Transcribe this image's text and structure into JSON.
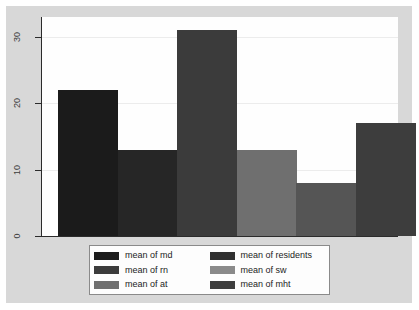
{
  "chart_data": {
    "type": "bar",
    "title": "",
    "subtitle": "",
    "xlabel": "",
    "ylabel": "",
    "categories": [
      "md",
      "rn",
      "at",
      "residents",
      "sw",
      "mht"
    ],
    "values": [
      22,
      13,
      31,
      13,
      8,
      17
    ],
    "series": [
      {
        "name": "means",
        "values": [
          22,
          13,
          31,
          13,
          8,
          17
        ]
      }
    ],
    "bars": [
      {
        "category": "md",
        "label": "mean of md",
        "value": 22,
        "color": "#1b1b1b"
      },
      {
        "category": "rn",
        "label": "mean of rn",
        "value": 13,
        "color": "#262626"
      },
      {
        "category": "at",
        "label": "mean of at",
        "value": 31,
        "color": "#3b3b3b"
      },
      {
        "category": "residents",
        "label": "mean of residents",
        "value": 13,
        "color": "#6f6f6f"
      },
      {
        "category": "sw",
        "label": "mean of sw",
        "value": 8,
        "color": "#555555"
      },
      {
        "category": "mht",
        "label": "mean of mht",
        "value": 17,
        "color": "#3d3d3d"
      }
    ],
    "ylim": [
      0,
      33
    ],
    "yticks": [
      0,
      10,
      20,
      30
    ],
    "ytick_labels": [
      "0",
      "10",
      "20",
      "30"
    ],
    "xticks": [],
    "xtick_labels": [],
    "grid": "horizontal-faint",
    "legend_position": "below-center",
    "legend_columns": 2,
    "legend": [
      [
        {
          "label": "mean of md",
          "color": "#1b1b1b"
        },
        {
          "label": "mean of residents",
          "color": "#303030"
        }
      ],
      [
        {
          "label": "mean of rn",
          "color": "#3b3b3b"
        },
        {
          "label": "mean of sw",
          "color": "#8a8a8a"
        }
      ],
      [
        {
          "label": "mean of at",
          "color": "#6f6f6f"
        },
        {
          "label": "mean of mht",
          "color": "#3d3d3d"
        }
      ]
    ],
    "colors": {
      "graph_background": "#d8d8d8",
      "plot_background": "#fefefe",
      "axis": "#2b2b2b",
      "gridline": "#ececec",
      "legend_border": "#8a8a8a",
      "text": "#1c1c1c"
    }
  }
}
